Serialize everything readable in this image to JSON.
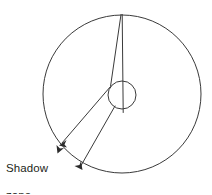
{
  "figure": {
    "background_color": "#ffffff",
    "stroke_color": "#3a3a3a",
    "text_color": "#231f20",
    "labels": {
      "shadow_zone_line1": "Shadow",
      "shadow_zone_line2": "zone"
    },
    "shapes": {
      "outer_circle": {
        "name": "earth-outline",
        "cx": 122,
        "cy": 94,
        "r": 79
      },
      "inner_circle": {
        "name": "core-outline",
        "cx": 122,
        "cy": 95,
        "r": 14
      }
    },
    "rays": [
      {
        "name": "direct-ray",
        "from_x": 122,
        "from_y": 15,
        "to_x": 123,
        "to_y": 112
      },
      {
        "name": "refracted-ray-left",
        "from_x": 121,
        "from_y": 15,
        "to_x": 61,
        "to_y": 144
      },
      {
        "name": "refracted-ray-lower",
        "from_x": 116,
        "from_y": 107,
        "to_x": 81,
        "to_y": 168
      }
    ],
    "arrows": [
      {
        "name": "arrow-ray-endpoint-upper",
        "x": 61,
        "y": 144,
        "angle": 245
      },
      {
        "name": "arrow-shadow-arc-start",
        "x": 59,
        "y": 151,
        "angle": 72
      },
      {
        "name": "arrow-ray-endpoint-lower",
        "x": 81,
        "y": 168,
        "angle": 60
      }
    ],
    "shadow_arc": {
      "name": "shadow-zone-arc",
      "start_x": 59,
      "start_y": 149,
      "end_x": 82,
      "end_y": 169
    }
  }
}
